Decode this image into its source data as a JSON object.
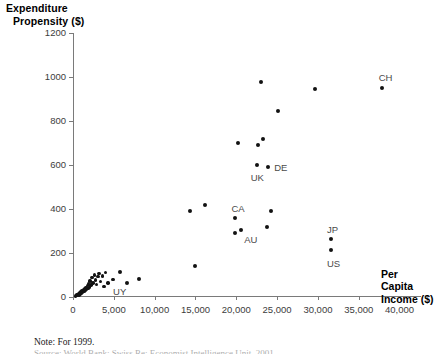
{
  "chart_data": {
    "type": "scatter",
    "title": "",
    "ylabel_line1": "Expenditure",
    "ylabel_line2": "Propensity ($)",
    "xlabel_line1": "Per",
    "xlabel_line2": "Capita",
    "xlabel_line3": "Income ($)",
    "xlabel": "Per Capita Income ($)",
    "ylabel": "Expenditure Propensity ($)",
    "xlim": [
      0,
      42500
    ],
    "ylim": [
      0,
      1200
    ],
    "xticks": [
      0,
      5000,
      10000,
      15000,
      20000,
      25000,
      30000,
      35000,
      40000
    ],
    "xtick_labels": [
      "0",
      "5,000",
      "10,000",
      "15,000",
      "20,000",
      "25,000",
      "30,000",
      "35,000",
      "40,000"
    ],
    "yticks": [
      0,
      200,
      400,
      600,
      800,
      1000,
      1200
    ],
    "ytick_labels": [
      "0",
      "200",
      "400",
      "600",
      "800",
      "1000",
      "1200"
    ],
    "grid": false,
    "legend": false,
    "marker_color": "#121212",
    "axis_color": "#7a7a7a",
    "points": [
      {
        "x": 300,
        "y": 5,
        "label": ""
      },
      {
        "x": 420,
        "y": 8,
        "label": ""
      },
      {
        "x": 480,
        "y": 12,
        "label": ""
      },
      {
        "x": 560,
        "y": 6,
        "label": ""
      },
      {
        "x": 640,
        "y": 16,
        "label": ""
      },
      {
        "x": 720,
        "y": 10,
        "label": ""
      },
      {
        "x": 780,
        "y": 20,
        "label": ""
      },
      {
        "x": 860,
        "y": 14,
        "label": ""
      },
      {
        "x": 940,
        "y": 24,
        "label": ""
      },
      {
        "x": 1020,
        "y": 18,
        "label": ""
      },
      {
        "x": 1100,
        "y": 28,
        "label": ""
      },
      {
        "x": 1180,
        "y": 22,
        "label": ""
      },
      {
        "x": 1260,
        "y": 33,
        "label": ""
      },
      {
        "x": 1340,
        "y": 26,
        "label": ""
      },
      {
        "x": 1420,
        "y": 38,
        "label": ""
      },
      {
        "x": 1500,
        "y": 30,
        "label": ""
      },
      {
        "x": 1580,
        "y": 44,
        "label": ""
      },
      {
        "x": 1660,
        "y": 35,
        "label": ""
      },
      {
        "x": 1740,
        "y": 52,
        "label": ""
      },
      {
        "x": 1820,
        "y": 40,
        "label": ""
      },
      {
        "x": 1900,
        "y": 60,
        "label": ""
      },
      {
        "x": 2000,
        "y": 46,
        "label": ""
      },
      {
        "x": 2100,
        "y": 72,
        "label": ""
      },
      {
        "x": 2200,
        "y": 55,
        "label": ""
      },
      {
        "x": 2350,
        "y": 88,
        "label": ""
      },
      {
        "x": 2450,
        "y": 64,
        "label": ""
      },
      {
        "x": 2600,
        "y": 100,
        "label": ""
      },
      {
        "x": 2750,
        "y": 78,
        "label": ""
      },
      {
        "x": 2900,
        "y": 58,
        "label": ""
      },
      {
        "x": 3050,
        "y": 92,
        "label": ""
      },
      {
        "x": 3200,
        "y": 106,
        "label": ""
      },
      {
        "x": 3400,
        "y": 70,
        "label": ""
      },
      {
        "x": 3600,
        "y": 96,
        "label": ""
      },
      {
        "x": 3800,
        "y": 48,
        "label": ""
      },
      {
        "x": 4000,
        "y": 112,
        "label": ""
      },
      {
        "x": 4300,
        "y": 64,
        "label": "UY"
      },
      {
        "x": 4900,
        "y": 80,
        "label": ""
      },
      {
        "x": 5700,
        "y": 112,
        "label": ""
      },
      {
        "x": 6600,
        "y": 62,
        "label": ""
      },
      {
        "x": 8100,
        "y": 82,
        "label": ""
      },
      {
        "x": 14300,
        "y": 390,
        "label": ""
      },
      {
        "x": 14900,
        "y": 140,
        "label": ""
      },
      {
        "x": 16200,
        "y": 418,
        "label": ""
      },
      {
        "x": 19900,
        "y": 360,
        "label": "CA"
      },
      {
        "x": 19800,
        "y": 290,
        "label": ""
      },
      {
        "x": 20600,
        "y": 303,
        "label": "AU"
      },
      {
        "x": 20200,
        "y": 700,
        "label": ""
      },
      {
        "x": 22600,
        "y": 690,
        "label": ""
      },
      {
        "x": 23300,
        "y": 717,
        "label": ""
      },
      {
        "x": 22500,
        "y": 600,
        "label": "UK"
      },
      {
        "x": 23900,
        "y": 592,
        "label": "DE"
      },
      {
        "x": 24200,
        "y": 390,
        "label": ""
      },
      {
        "x": 23700,
        "y": 318,
        "label": ""
      },
      {
        "x": 23000,
        "y": 978,
        "label": ""
      },
      {
        "x": 25100,
        "y": 845,
        "label": ""
      },
      {
        "x": 29600,
        "y": 945,
        "label": ""
      },
      {
        "x": 31600,
        "y": 262,
        "label": "JP"
      },
      {
        "x": 31600,
        "y": 212,
        "label": "US"
      },
      {
        "x": 37800,
        "y": 950,
        "label": "CH"
      }
    ],
    "annotations": [
      {
        "text": "UY",
        "x": 4300,
        "y": 64
      },
      {
        "text": "CA",
        "x": 19900,
        "y": 360
      },
      {
        "text": "AU",
        "x": 20600,
        "y": 303
      },
      {
        "text": "UK",
        "x": 22500,
        "y": 600
      },
      {
        "text": "DE",
        "x": 23900,
        "y": 592
      },
      {
        "text": "JP",
        "x": 31600,
        "y": 262
      },
      {
        "text": "US",
        "x": 31600,
        "y": 212
      },
      {
        "text": "CH",
        "x": 37800,
        "y": 950
      }
    ]
  },
  "notes": {
    "note_line": "Note: For 1999.",
    "source_line_clipped": "Source: World Bank; Swiss Re; Economist Intelligence Unit, 2001"
  }
}
